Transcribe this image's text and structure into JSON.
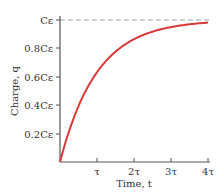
{
  "chart_data": {
    "type": "line",
    "title": "",
    "xlabel": "Time, t",
    "ylabel": "Charge, q",
    "x_ticks": [
      "τ",
      "2τ",
      "3τ",
      "4τ"
    ],
    "y_ticks": [
      "0.2Cε",
      "0.4Cε",
      "0.6Cε",
      "0.8Cε",
      "Cε"
    ],
    "xlim": [
      0,
      4
    ],
    "ylim": [
      0,
      1
    ],
    "grid": false,
    "asymptote": {
      "label": "Cε",
      "value": 1,
      "style": "dashed"
    },
    "series": [
      {
        "name": "q(t) = Cε(1 − e^(−t/τ))",
        "x": [
          0,
          0.25,
          0.5,
          0.75,
          1,
          1.5,
          2,
          2.5,
          3,
          3.5,
          4
        ],
        "values": [
          0,
          0.221,
          0.393,
          0.528,
          0.632,
          0.777,
          0.865,
          0.918,
          0.95,
          0.97,
          0.982
        ]
      }
    ]
  },
  "colors": {
    "curve": "#d63a3a",
    "asymptote": "#9aa3b5",
    "axis": "#555555"
  }
}
